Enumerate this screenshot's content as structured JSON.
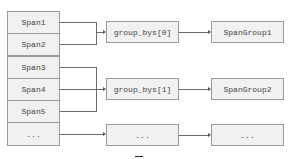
{
  "diagram": {
    "spans": [
      {
        "label": "Span1"
      },
      {
        "label": "Span2"
      },
      {
        "label": "Span3"
      },
      {
        "label": "Span4"
      },
      {
        "label": "Span5"
      },
      {
        "label": "..."
      }
    ],
    "group_bys": [
      {
        "label": "group_bys[0]"
      },
      {
        "label": "group_bys[1]"
      },
      {
        "label": "..."
      }
    ],
    "span_groups": [
      {
        "label": "SpanGroup1"
      },
      {
        "label": "SpanGroup2"
      },
      {
        "label": "..."
      }
    ],
    "connections": [
      {
        "from": [
          "Span1",
          "Span2"
        ],
        "to": "group_bys[0]"
      },
      {
        "from": [
          "Span3",
          "Span4",
          "Span5"
        ],
        "to": "group_bys[1]"
      },
      {
        "from": [
          "..."
        ],
        "to": "..."
      },
      {
        "from": [
          "group_bys[0]"
        ],
        "to": "SpanGroup1"
      },
      {
        "from": [
          "group_bys[1]"
        ],
        "to": "SpanGroup2"
      },
      {
        "from": [
          "..."
        ],
        "to": "..."
      }
    ],
    "colors": {
      "box_fill": "#f1f1f1",
      "box_border": "#9a9a9a",
      "line": "#6a6a6a",
      "text": "#444444"
    }
  }
}
